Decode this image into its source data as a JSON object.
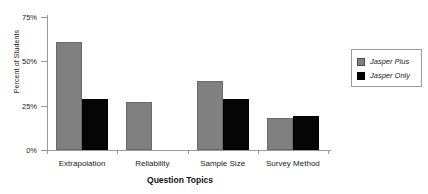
{
  "chart_data": {
    "type": "bar",
    "title": "",
    "xlabel": "Question Topics",
    "ylabel": "Percent of Students",
    "categories": [
      "Extrapolation",
      "Reliability",
      "Sample Size",
      "Survey Method"
    ],
    "series": [
      {
        "name": "Jasper Plus",
        "color": "#808080",
        "values": [
          61,
          27,
          39,
          18
        ]
      },
      {
        "name": "Jasper Only",
        "color": "#050505",
        "values": [
          29,
          0,
          29,
          19
        ]
      }
    ],
    "ylim": [
      0,
      75
    ],
    "yticks": [
      0,
      25,
      50,
      75
    ],
    "ytick_labels": [
      "0%",
      "25%",
      "50%",
      "75%"
    ],
    "grid": false,
    "legend_position": "right"
  },
  "legend": {
    "items": [
      {
        "label": "Jasper Plus",
        "swatch": "gray-swatch"
      },
      {
        "label": "Jasper Only",
        "swatch": "black-swatch"
      }
    ]
  }
}
